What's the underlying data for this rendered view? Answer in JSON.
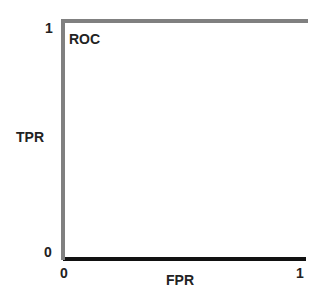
{
  "chart_data": {
    "type": "line",
    "title": "ROC",
    "xlabel": "FPR",
    "ylabel": "TPR",
    "xlim": [
      0,
      1
    ],
    "ylim": [
      0,
      1
    ],
    "x_ticks": [
      "0",
      "1"
    ],
    "y_ticks": [
      "0",
      "1"
    ],
    "grid": false,
    "series": [
      {
        "name": "ROC curve",
        "color": "#808080",
        "points": [
          [
            0,
            0
          ],
          [
            0,
            1
          ],
          [
            1,
            1
          ]
        ]
      }
    ],
    "x_axis_color": "#111111"
  }
}
